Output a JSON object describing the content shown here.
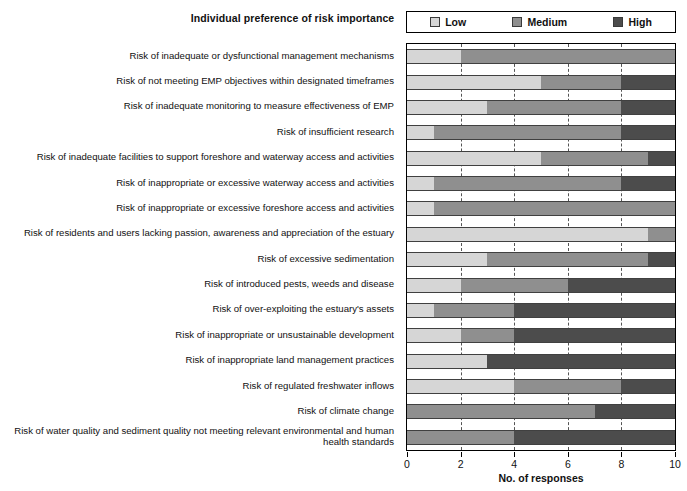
{
  "chart_data": {
    "type": "bar",
    "orientation": "horizontal",
    "stacked": true,
    "title": "Individual preference of risk importance",
    "xlabel": "No. of responses",
    "ylabel": "",
    "xlim": [
      0,
      10
    ],
    "xticks": [
      0,
      2,
      4,
      6,
      8,
      10
    ],
    "grid": "vertical-dashed",
    "legend_position": "top-right",
    "colors": {
      "Low": "#d6d6d6",
      "Medium": "#8f8f8f",
      "High": "#4c4c4c"
    },
    "legend": [
      {
        "label": "Low",
        "color": "#d6d6d6"
      },
      {
        "label": "Medium",
        "color": "#8f8f8f"
      },
      {
        "label": "High",
        "color": "#4c4c4c"
      }
    ],
    "categories": [
      "Risk of inadequate or dysfunctional management mechanisms",
      "Risk of not meeting EMP objectives within designated timeframes",
      "Risk of inadequate monitoring to measure effectiveness of EMP",
      "Risk of insufficient research",
      "Risk of inadequate facilities to support foreshore and waterway access and activities",
      "Risk of inappropriate or excessive waterway access and activities",
      "Risk of inappropriate or excessive foreshore access and activities",
      "Risk of residents and users lacking passion, awareness and appreciation of the estuary",
      "Risk of excessive sedimentation",
      "Risk of introduced pests, weeds and disease",
      "Risk of over-exploiting the estuary's assets",
      "Risk of inappropriate or unsustainable development",
      "Risk of inappropriate land management practices",
      "Risk of regulated freshwater inflows",
      "Risk of climate change",
      "Risk of water quality and sediment quality not meeting relevant environmental and human health standards"
    ],
    "series": [
      {
        "name": "Low",
        "values": [
          2,
          5,
          3,
          1,
          5,
          1,
          1,
          9,
          3,
          2,
          1,
          2,
          3,
          4,
          0,
          0
        ]
      },
      {
        "name": "Medium",
        "values": [
          8,
          3,
          5,
          7,
          4,
          7,
          9,
          1,
          6,
          4,
          3,
          2,
          0,
          4,
          7,
          4
        ]
      },
      {
        "name": "High",
        "values": [
          0,
          2,
          2,
          2,
          1,
          2,
          0,
          0,
          1,
          4,
          6,
          6,
          7,
          2,
          3,
          6
        ]
      }
    ]
  }
}
